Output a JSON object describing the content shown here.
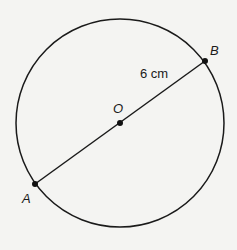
{
  "diagram": {
    "type": "circle-with-diameter",
    "colors": {
      "background": "#f4f4f2",
      "stroke": "#1a1a1a"
    },
    "circle": {
      "center_label": "O",
      "cx": 120,
      "cy": 123,
      "r": 104
    },
    "points": [
      {
        "label": "A",
        "x": 35,
        "y": 184
      },
      {
        "label": "O",
        "x": 120,
        "y": 123
      },
      {
        "label": "B",
        "x": 205,
        "y": 61
      }
    ],
    "segment": {
      "from": "A",
      "to": "B",
      "measure_label": "6 cm",
      "measure_applies_to": "OB"
    },
    "labels": {
      "A": "A",
      "B": "B",
      "O": "O",
      "measure": "6 cm"
    }
  }
}
